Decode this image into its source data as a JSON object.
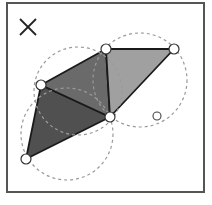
{
  "diagram": {
    "frame": {
      "x": 7,
      "y": 3,
      "width": 197,
      "height": 189,
      "stroke": "#555555"
    },
    "cross_mark": {
      "x1": 20,
      "y1": 19,
      "x2": 36,
      "y2": 35,
      "x3": 36,
      "y3": 19,
      "x4": 20,
      "y4": 35
    },
    "points": [
      {
        "id": "A",
        "x": 26,
        "y": 159
      },
      {
        "id": "B",
        "x": 41,
        "y": 85
      },
      {
        "id": "C",
        "x": 106,
        "y": 49
      },
      {
        "id": "D",
        "x": 110,
        "y": 117
      },
      {
        "id": "E",
        "x": 174,
        "y": 49
      }
    ],
    "query_point": {
      "x": 157,
      "y": 116
    },
    "triangles": [
      {
        "id": "ABD",
        "points": "26,159 41,85 110,117",
        "fill": "#505050"
      },
      {
        "id": "BCD",
        "points": "41,85 106,49 110,117",
        "fill": "#6a6a6a"
      },
      {
        "id": "CED",
        "points": "106,49 174,49 110,117",
        "fill": "#a0a0a0"
      }
    ],
    "circumcircles": [
      {
        "cx": 67,
        "cy": 134,
        "r": 46
      },
      {
        "cx": 78,
        "cy": 91,
        "r": 44
      },
      {
        "cx": 140,
        "cy": 80,
        "r": 47
      }
    ],
    "colors": {
      "circle_stroke": "#9a9a9a",
      "edge_stroke": "#1a1a1a",
      "point_fill": "#ffffff",
      "point_stroke": "#333333"
    }
  }
}
